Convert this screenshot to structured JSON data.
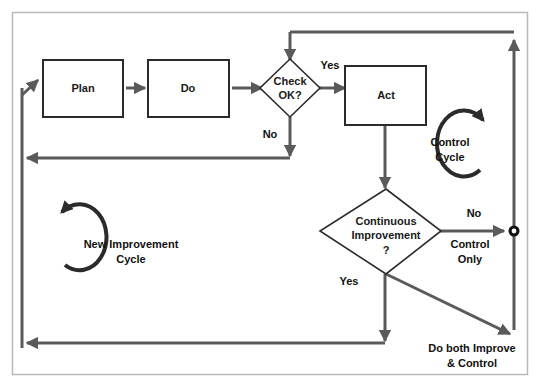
{
  "diagram": {
    "frame_color": "#b9b9b9",
    "line_color": "#5a5a5a",
    "node_border_color": "#2b2b2b",
    "text_color": "#111111",
    "background": "#ffffff",
    "nodes": [
      {
        "id": "plan",
        "type": "process",
        "label": "Plan"
      },
      {
        "id": "do",
        "type": "process",
        "label": "Do"
      },
      {
        "id": "check",
        "type": "decision",
        "label_line1": "Check",
        "label_line2": "OK?"
      },
      {
        "id": "act",
        "type": "process",
        "label": "Act"
      },
      {
        "id": "continuous",
        "type": "decision",
        "label_line1": "Continuous",
        "label_line2": "Improvement",
        "label_line3": "?"
      },
      {
        "id": "junction",
        "type": "connector",
        "label": "junction-node"
      }
    ],
    "edge_labels": {
      "check_yes": "Yes",
      "check_no": "No",
      "continuous_no": "No",
      "continuous_yes": "Yes",
      "control_only": "Control\nOnly",
      "control_only_line1": "Control",
      "control_only_line2": "Only",
      "do_both_line1": "Do both Improve",
      "do_both_line2": "& Control"
    },
    "annotations": {
      "control_cycle_line1": "Control",
      "control_cycle_line2": "Cycle",
      "new_improvement_line1": "New Improvement",
      "new_improvement_line2": "Cycle"
    }
  }
}
